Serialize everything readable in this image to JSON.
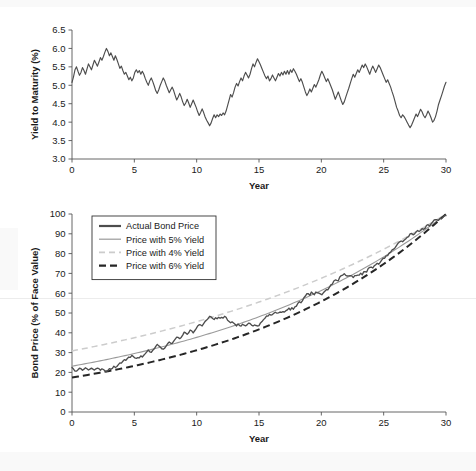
{
  "figure": {
    "background": "#ffffff",
    "width": 476,
    "height": 471
  },
  "chart_data": [
    {
      "type": "line",
      "id": "yield-to-maturity",
      "title": "",
      "xlabel": "Year",
      "ylabel": "Yield to Maturity (%)",
      "xlim": [
        0,
        30
      ],
      "ylim": [
        3.0,
        6.5
      ],
      "xticks": [
        0,
        5,
        10,
        15,
        20,
        25,
        30
      ],
      "yticks": [
        3.0,
        3.5,
        4.0,
        4.5,
        5.0,
        5.5,
        6.0,
        6.5
      ],
      "xtick_labels": [
        "0",
        "5",
        "10",
        "15",
        "20",
        "25",
        "30"
      ],
      "ytick_labels": [
        "3.0",
        "3.5",
        "4.0",
        "4.5",
        "5.0",
        "5.5",
        "6.0",
        "6.5"
      ],
      "grid": false,
      "legend": null,
      "series": [
        {
          "name": "Yield to Maturity",
          "color": "#4d4d4d",
          "style": "solid",
          "width": 1.15,
          "x": [
            0,
            0.12,
            0.24,
            0.36,
            0.48,
            0.6,
            0.72,
            0.84,
            0.96,
            1.08,
            1.2,
            1.32,
            1.44,
            1.56,
            1.68,
            1.8,
            1.92,
            2.04,
            2.16,
            2.28,
            2.4,
            2.52,
            2.64,
            2.76,
            2.88,
            3,
            3.12,
            3.24,
            3.36,
            3.48,
            3.6,
            3.72,
            3.84,
            3.96,
            4.08,
            4.2,
            4.32,
            4.44,
            4.56,
            4.68,
            4.8,
            4.92,
            5.04,
            5.16,
            5.28,
            5.4,
            5.52,
            5.64,
            5.76,
            5.88,
            6,
            6.12,
            6.24,
            6.36,
            6.48,
            6.6,
            6.72,
            6.84,
            6.96,
            7.08,
            7.2,
            7.32,
            7.44,
            7.56,
            7.68,
            7.8,
            7.92,
            8.04,
            8.16,
            8.28,
            8.4,
            8.52,
            8.64,
            8.76,
            8.88,
            9,
            9.12,
            9.24,
            9.36,
            9.48,
            9.6,
            9.72,
            9.84,
            9.96,
            10.08,
            10.2,
            10.32,
            10.44,
            10.56,
            10.68,
            10.8,
            10.92,
            11.04,
            11.16,
            11.28,
            11.4,
            11.52,
            11.64,
            11.76,
            11.88,
            12,
            12.12,
            12.24,
            12.36,
            12.48,
            12.6,
            12.72,
            12.84,
            12.96,
            13.08,
            13.2,
            13.32,
            13.44,
            13.56,
            13.68,
            13.8,
            13.92,
            14.04,
            14.16,
            14.28,
            14.4,
            14.52,
            14.64,
            14.76,
            14.88,
            15,
            15.12,
            15.24,
            15.36,
            15.48,
            15.6,
            15.72,
            15.84,
            15.96,
            16.08,
            16.2,
            16.32,
            16.44,
            16.56,
            16.68,
            16.8,
            16.92,
            17.04,
            17.16,
            17.28,
            17.4,
            17.52,
            17.64,
            17.76,
            17.88,
            18,
            18.12,
            18.24,
            18.36,
            18.48,
            18.6,
            18.72,
            18.84,
            18.96,
            19.08,
            19.2,
            19.32,
            19.44,
            19.56,
            19.68,
            19.8,
            19.92,
            20.04,
            20.16,
            20.28,
            20.4,
            20.52,
            20.64,
            20.76,
            20.88,
            21,
            21.12,
            21.24,
            21.36,
            21.48,
            21.6,
            21.72,
            21.84,
            21.96,
            22.08,
            22.2,
            22.32,
            22.44,
            22.56,
            22.68,
            22.8,
            22.92,
            23.04,
            23.16,
            23.28,
            23.4,
            23.52,
            23.64,
            23.76,
            23.88,
            24,
            24.12,
            24.24,
            24.36,
            24.48,
            24.6,
            24.72,
            24.84,
            24.96,
            25.08,
            25.2,
            25.32,
            25.44,
            25.56,
            25.68,
            25.8,
            25.92,
            26.04,
            26.16,
            26.28,
            26.4,
            26.52,
            26.64,
            26.76,
            26.88,
            27,
            27.12,
            27.24,
            27.36,
            27.48,
            27.6,
            27.72,
            27.84,
            27.96,
            28.08,
            28.2,
            28.32,
            28.44,
            28.56,
            28.68,
            28.8,
            28.92,
            29.04,
            29.16,
            29.28,
            29.4,
            29.52,
            29.64,
            29.76,
            29.88,
            30
          ],
          "y": [
            5.08,
            5.23,
            5.42,
            5.5,
            5.38,
            5.27,
            5.35,
            5.48,
            5.4,
            5.3,
            5.44,
            5.58,
            5.5,
            5.42,
            5.55,
            5.68,
            5.6,
            5.52,
            5.63,
            5.75,
            5.68,
            5.78,
            5.9,
            6.0,
            5.92,
            5.8,
            5.88,
            5.78,
            5.68,
            5.8,
            5.7,
            5.58,
            5.46,
            5.52,
            5.4,
            5.3,
            5.35,
            5.25,
            5.15,
            5.22,
            5.12,
            5.2,
            5.35,
            5.42,
            5.34,
            5.4,
            5.3,
            5.38,
            5.3,
            5.18,
            5.08,
            5.0,
            5.12,
            5.2,
            5.1,
            4.98,
            4.85,
            4.78,
            4.88,
            5.0,
            5.1,
            5.2,
            5.12,
            5.0,
            4.9,
            4.8,
            4.88,
            4.95,
            4.85,
            4.72,
            4.6,
            4.68,
            4.78,
            4.68,
            4.55,
            4.45,
            4.52,
            4.62,
            4.52,
            4.4,
            4.5,
            4.6,
            4.5,
            4.4,
            4.28,
            4.18,
            4.26,
            4.36,
            4.26,
            4.14,
            4.05,
            3.98,
            3.9,
            3.98,
            4.1,
            4.2,
            4.12,
            4.2,
            4.15,
            4.22,
            4.18,
            4.25,
            4.2,
            4.3,
            4.45,
            4.6,
            4.75,
            4.68,
            4.8,
            4.95,
            5.05,
            4.98,
            5.1,
            5.2,
            5.12,
            5.25,
            5.35,
            5.28,
            5.2,
            5.3,
            5.45,
            5.58,
            5.5,
            5.62,
            5.72,
            5.64,
            5.55,
            5.45,
            5.35,
            5.25,
            5.18,
            5.25,
            5.12,
            5.18,
            5.28,
            5.2,
            5.12,
            5.22,
            5.32,
            5.25,
            5.35,
            5.28,
            5.38,
            5.3,
            5.4,
            5.3,
            5.42,
            5.35,
            5.45,
            5.38,
            5.3,
            5.2,
            5.1,
            5.18,
            5.08,
            4.95,
            4.82,
            4.72,
            4.8,
            4.9,
            4.82,
            4.92,
            5.02,
            4.95,
            5.05,
            5.15,
            5.28,
            5.38,
            5.3,
            5.2,
            5.1,
            5.18,
            5.08,
            4.98,
            4.88,
            4.75,
            4.62,
            4.72,
            4.82,
            4.7,
            4.58,
            4.48,
            4.55,
            4.68,
            4.8,
            4.92,
            5.05,
            5.18,
            5.3,
            5.22,
            5.32,
            5.42,
            5.35,
            5.45,
            5.55,
            5.48,
            5.58,
            5.5,
            5.4,
            5.3,
            5.42,
            5.52,
            5.44,
            5.35,
            5.45,
            5.55,
            5.48,
            5.38,
            5.28,
            5.18,
            5.08,
            5.15,
            5.05,
            4.95,
            4.82,
            4.7,
            4.55,
            4.4,
            4.3,
            4.18,
            4.12,
            4.2,
            4.15,
            4.08,
            4.0,
            3.92,
            3.85,
            3.92,
            4.02,
            4.12,
            4.22,
            4.15,
            4.25,
            4.35,
            4.28,
            4.18,
            4.12,
            4.2,
            4.3,
            4.22,
            4.12,
            4.0,
            4.05,
            4.15,
            4.3,
            4.48,
            4.6,
            4.72,
            4.85,
            4.98,
            5.08,
            5.2,
            5.28,
            5.38,
            5.3,
            5.42,
            5.52,
            5.62,
            5.68,
            5.6,
            5.5,
            5.4,
            5.3,
            5.38,
            5.3,
            5.22,
            5.3,
            5.38,
            5.28,
            5.18,
            5.28,
            5.38,
            5.48,
            5.55
          ]
        }
      ]
    },
    {
      "type": "line",
      "id": "bond-price",
      "title": "",
      "xlabel": "Year",
      "ylabel": "Bond Price (% of Face Value)",
      "xlim": [
        0,
        30
      ],
      "ylim": [
        0,
        100
      ],
      "xticks": [
        0,
        5,
        10,
        15,
        20,
        25,
        30
      ],
      "yticks": [
        0,
        10,
        20,
        30,
        40,
        50,
        60,
        70,
        80,
        90,
        100
      ],
      "xtick_labels": [
        "0",
        "10",
        "20",
        "30",
        "40",
        "50",
        "60",
        "70",
        "80",
        "90",
        "100"
      ],
      "grid": false,
      "legend": {
        "position": "upper-left",
        "border_color": "#333333",
        "background": "#ffffff",
        "entries": [
          {
            "label": "Actual Bond Price",
            "color": "#4d4d4d",
            "style": "solid",
            "width": 2.2
          },
          {
            "label": "Price with 5% Yield",
            "color": "#9a9a9a",
            "style": "solid",
            "width": 1.2
          },
          {
            "label": "Price with 4% Yield",
            "color": "#cccccc",
            "style": "dashed",
            "width": 1.6
          },
          {
            "label": "Price with 6% Yield",
            "color": "#262626",
            "style": "dashed",
            "width": 2.2
          }
        ]
      },
      "series": [
        {
          "name": "Actual Bond Price",
          "color": "#4d4d4d",
          "style": "solid",
          "width": 1.35,
          "note": "Price = 100 / (1+y)^(30-t) using the yield path above"
        },
        {
          "name": "Price with 5% Yield",
          "color": "#9a9a9a",
          "style": "solid",
          "width": 1.1,
          "yield": 0.05,
          "anchor_points": [
            [
              0,
              23.1
            ],
            [
              10,
              37.7
            ],
            [
              20,
              61.4
            ],
            [
              30,
              100
            ]
          ]
        },
        {
          "name": "Price with 4% Yield",
          "color": "#cccccc",
          "style": "dashed",
          "width": 1.5,
          "yield": 0.04,
          "anchor_points": [
            [
              0,
              30.8
            ],
            [
              10,
              45.6
            ],
            [
              20,
              67.6
            ],
            [
              30,
              100
            ]
          ]
        },
        {
          "name": "Price with 6% Yield",
          "color": "#262626",
          "style": "dashed",
          "width": 2.0,
          "yield": 0.06,
          "anchor_points": [
            [
              0,
              17.4
            ],
            [
              10,
              31.2
            ],
            [
              20,
              55.8
            ],
            [
              30,
              100
            ]
          ]
        }
      ]
    }
  ]
}
